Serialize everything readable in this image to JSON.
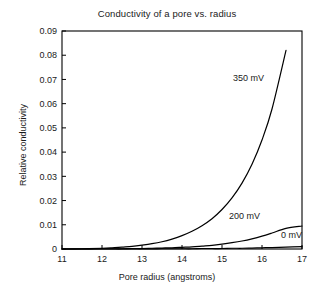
{
  "chart_data": {
    "type": "line",
    "title": "Conductivity of a pore vs. radius",
    "xlabel": "Pore radius (angstroms)",
    "ylabel": "Relative conductivity",
    "xlim": [
      11,
      17
    ],
    "ylim": [
      0,
      0.09
    ],
    "grid": false,
    "legend_position": "inline-annotations",
    "xticks": [
      11,
      12,
      13,
      14,
      15,
      16,
      17
    ],
    "xtick_labels": [
      "11",
      "12",
      "13",
      "14",
      "15",
      "16",
      "17"
    ],
    "yticks": [
      0,
      0.01,
      0.02,
      0.03,
      0.04,
      0.05,
      0.06,
      0.07,
      0.08,
      0.09
    ],
    "ytick_labels": [
      "0",
      "0.01",
      "0.02",
      "0.03",
      "0.04",
      "0.05",
      "0.06",
      "0.07",
      "0.08",
      "0.09"
    ],
    "x": [
      11,
      11.5,
      12,
      12.25,
      12.5,
      12.75,
      13,
      13.25,
      13.5,
      13.75,
      14,
      14.25,
      14.5,
      14.75,
      15,
      15.25,
      15.5,
      15.75,
      16,
      16.25,
      16.6,
      17
    ],
    "series": [
      {
        "name": "350 mV",
        "label": "350 mV",
        "color": "#000000",
        "values": [
          0.0,
          0.0001,
          0.0003,
          0.0005,
          0.0008,
          0.0011,
          0.0016,
          0.0022,
          0.003,
          0.0041,
          0.0055,
          0.0073,
          0.0096,
          0.0125,
          0.0163,
          0.0211,
          0.0272,
          0.035,
          0.045,
          0.0578,
          0.082,
          null
        ]
      },
      {
        "name": "200 mV",
        "label": "200 mV",
        "color": "#000000",
        "values": [
          0.0,
          0.0,
          0.0001,
          0.0001,
          0.0001,
          0.0002,
          0.0002,
          0.0003,
          0.0004,
          0.0005,
          0.0007,
          0.0009,
          0.0012,
          0.0015,
          0.002,
          0.0026,
          0.0033,
          0.0042,
          0.0053,
          0.0066,
          0.0085,
          0.0095
        ]
      },
      {
        "name": "0 mV",
        "label": "0 mV",
        "color": "#000000",
        "values": [
          0.0,
          0.0,
          0.0,
          0.0,
          0.0,
          0.0,
          0.0,
          0.0,
          0.0001,
          0.0001,
          0.0001,
          0.0001,
          0.0002,
          0.0002,
          0.0002,
          0.0003,
          0.0003,
          0.0004,
          0.0005,
          0.0006,
          0.0008,
          0.001
        ]
      }
    ],
    "annotations": [
      {
        "text": "350 mV",
        "x": 16.05,
        "y": 0.0695,
        "anchor": "end"
      },
      {
        "text": "200 mV",
        "x": 15.95,
        "y": 0.0122,
        "anchor": "end"
      },
      {
        "text": "0 mV",
        "x": 17.0,
        "y": 0.0045,
        "anchor": "end"
      }
    ]
  }
}
